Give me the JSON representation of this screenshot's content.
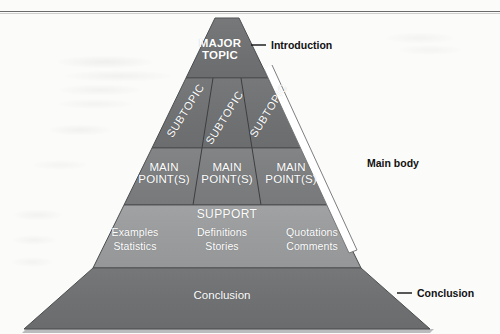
{
  "diagram": {
    "colors": {
      "apex_band": "#6f7173",
      "subtopic_band": "#6f7173",
      "mainpoint_band": "#7c7e80",
      "support_band": "#9b9d9e",
      "conclusion_band": "#6e7072",
      "divider": "#3c3e40",
      "outline": "#4a4c4e",
      "label_text": "#ffffff",
      "annotation_text": "#111111",
      "bracket": "#ffffff"
    },
    "bands": {
      "apex": {
        "label": "MAJOR\nTOPIC"
      },
      "subtopics": {
        "cells": [
          {
            "label": "SUBTOPIC",
            "rotation": -58
          },
          {
            "label": "SUBTOPIC",
            "rotation": -58
          },
          {
            "label": "SUBTOPIC",
            "rotation": -58
          }
        ]
      },
      "main_points": {
        "cells": [
          {
            "label": "MAIN\nPOINT(S)"
          },
          {
            "label": "MAIN\nPOINT(S)"
          },
          {
            "label": "MAIN\nPOINT(S)"
          }
        ]
      },
      "support": {
        "title": "SUPPORT",
        "columns": [
          {
            "line1": "Examples",
            "line2": "Statistics"
          },
          {
            "line1": "Definitions",
            "line2": "Stories"
          },
          {
            "line1": "Quotations",
            "line2": "Comments"
          }
        ]
      },
      "conclusion": {
        "label": "Conclusion"
      }
    },
    "annotations": [
      {
        "key": "introduction",
        "label": "Introduction"
      },
      {
        "key": "main_body",
        "label": "Main body"
      },
      {
        "key": "conclusion",
        "label": "Conclusion"
      }
    ]
  }
}
